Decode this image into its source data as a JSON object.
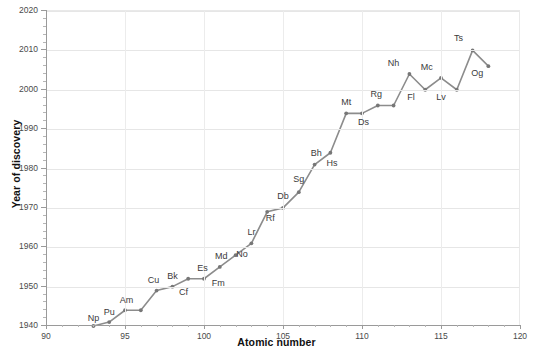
{
  "chart_data": {
    "type": "line",
    "title": "",
    "xlabel": "Atomic number",
    "ylabel": "Year of discovery",
    "xlim": [
      90,
      120
    ],
    "ylim": [
      1940,
      2020
    ],
    "xticks": [
      90,
      95,
      100,
      105,
      110,
      115,
      120
    ],
    "yticks": [
      1940,
      1950,
      1960,
      1970,
      1980,
      1990,
      2000,
      2010,
      2020
    ],
    "xtick_labels": [
      "90",
      "95",
      "100",
      "105",
      "110",
      "115",
      "120"
    ],
    "ytick_labels": [
      "1940",
      "1950",
      "1960",
      "1970",
      "1980",
      "1990",
      "2000",
      "2010",
      "2020"
    ],
    "grid": true,
    "legend": null,
    "line_color": "#8c8c8c",
    "marker_color": "#777777",
    "x": [
      93,
      94,
      95,
      96,
      97,
      98,
      99,
      100,
      101,
      102,
      103,
      104,
      105,
      106,
      107,
      108,
      109,
      110,
      111,
      112,
      113,
      114,
      115,
      116,
      117,
      118
    ],
    "values": [
      1940,
      1941,
      1944,
      1944,
      1949,
      1950,
      1952,
      1952,
      1955,
      1958,
      1961,
      1969,
      1970,
      1974,
      1981,
      1984,
      1994,
      1994,
      1996,
      1996,
      2004,
      2000,
      2003,
      2000,
      2010,
      2006
    ],
    "point_labels": [
      "Np",
      "Pu",
      "Am",
      "Cu",
      "Bk",
      "Cf",
      "Es",
      "Fm",
      "Md",
      "No",
      "Lr",
      "Rf",
      "Db",
      "Sg",
      "Bh",
      "Hs",
      "Mt",
      "Ds",
      "Rg",
      "Nh",
      "Fl",
      "Mc",
      "Lv",
      "Ts",
      "Og"
    ],
    "annotations": [
      {
        "label": "Np",
        "x": 93,
        "y": 1940,
        "lx": 93.0,
        "ly": 1941.8
      },
      {
        "label": "Pu",
        "x": 94,
        "y": 1941,
        "lx": 94.0,
        "ly": 1943.2
      },
      {
        "label": "Am",
        "x": 95,
        "y": 1944,
        "lx": 95.1,
        "ly": 1946.3
      },
      {
        "label": "Cu",
        "x": 97,
        "y": 1949,
        "lx": 96.8,
        "ly": 1951.4
      },
      {
        "label": "Bk",
        "x": 98,
        "y": 1950,
        "lx": 98.0,
        "ly": 1952.4
      },
      {
        "label": "Cf",
        "x": 98.6,
        "y": 1950,
        "lx": 98.7,
        "ly": 1948.4
      },
      {
        "label": "Es",
        "x": 100,
        "y": 1952,
        "lx": 99.9,
        "ly": 1954.4
      },
      {
        "label": "Fm",
        "x": 100.8,
        "y": 1952,
        "lx": 100.9,
        "ly": 1950.6
      },
      {
        "label": "Md",
        "x": 101,
        "y": 1955,
        "lx": 101.1,
        "ly": 1957.6
      },
      {
        "label": "No",
        "x": 102,
        "y": 1958,
        "lx": 102.4,
        "ly": 1958.0
      },
      {
        "label": "Lr",
        "x": 103,
        "y": 1961,
        "lx": 103.0,
        "ly": 1963.6
      },
      {
        "label": "Rf",
        "x": 104,
        "y": 1969,
        "lx": 104.2,
        "ly": 1967.3
      },
      {
        "label": "Db",
        "x": 105,
        "y": 1970,
        "lx": 105.0,
        "ly": 1972.8
      },
      {
        "label": "Sg",
        "x": 106,
        "y": 1974,
        "lx": 106.0,
        "ly": 1977.2
      },
      {
        "label": "Bh",
        "x": 107,
        "y": 1981,
        "lx": 107.1,
        "ly": 1983.6
      },
      {
        "label": "Hs",
        "x": 108,
        "y": 1984,
        "lx": 108.1,
        "ly": 1981.2
      },
      {
        "label": "Mt",
        "x": 109,
        "y": 1994,
        "lx": 109.0,
        "ly": 1996.6
      },
      {
        "label": "Ds",
        "x": 110,
        "y": 1994,
        "lx": 110.1,
        "ly": 1991.6
      },
      {
        "label": "Rg",
        "x": 111,
        "y": 1996,
        "lx": 110.9,
        "ly": 1998.6
      },
      {
        "label": "Nh",
        "x": 112,
        "y": 2004,
        "lx": 112.0,
        "ly": 2006.6
      },
      {
        "label": "Fl",
        "x": 113,
        "y": 2000,
        "lx": 113.1,
        "ly": 1998.0
      },
      {
        "label": "Mc",
        "x": 114,
        "y": 2003,
        "lx": 114.1,
        "ly": 2005.6
      },
      {
        "label": "Lv",
        "x": 115,
        "y": 2000,
        "lx": 115.0,
        "ly": 1997.8
      },
      {
        "label": "Ts",
        "x": 116,
        "y": 2010,
        "lx": 116.1,
        "ly": 2012.8
      },
      {
        "label": "Og",
        "x": 117,
        "y": 2006,
        "lx": 117.3,
        "ly": 2004.0
      }
    ]
  }
}
